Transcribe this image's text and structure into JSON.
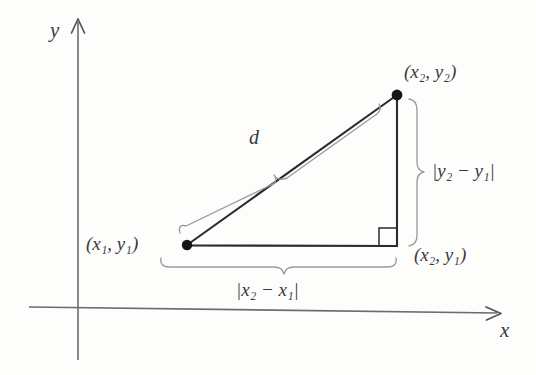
{
  "figure": {
    "background_color": "#fdfdfc",
    "axis_color": "#6b6b70",
    "triangle_color": "#2b2b2e",
    "brace_color": "#8d8d92",
    "label_color": "#3a3a3c",
    "axes": {
      "x_label": "x",
      "y_label": "y",
      "origin": {
        "x": 78,
        "y": 310
      }
    },
    "points": [
      {
        "name": "lower-left-vertex",
        "label": "(x₁, y₁)",
        "label_parts": {
          "open": "(",
          "a": "x",
          "a_sub": "1",
          "sep": ", ",
          "b": "y",
          "b_sub": "1",
          "close": ")"
        },
        "x": 187,
        "y": 245,
        "dot": true
      },
      {
        "name": "upper-right-vertex",
        "label": "(x₂, y₂)",
        "label_parts": {
          "open": "(",
          "a": "x",
          "a_sub": "2",
          "sep": ", ",
          "b": "y",
          "b_sub": "2",
          "close": ")"
        },
        "x": 397,
        "y": 95,
        "dot": true
      },
      {
        "name": "lower-right-vertex",
        "label": "(x₂, y₁)",
        "label_parts": {
          "open": "(",
          "a": "x",
          "a_sub": "2",
          "sep": ", ",
          "b": "y",
          "b_sub": "1",
          "close": ")"
        },
        "x": 397,
        "y": 245,
        "dot": false
      }
    ],
    "measures": {
      "hypotenuse": {
        "label": "d",
        "name": "distance-d"
      },
      "vertical_leg": {
        "label": "|y₂ − y₁|",
        "label_parts": {
          "bar1": "|",
          "a": "y",
          "a_sub": "2",
          "minus": " − ",
          "b": "y",
          "b_sub": "1",
          "bar2": "|"
        }
      },
      "horizontal_leg": {
        "label": "|x₂ − x₁|",
        "label_parts": {
          "bar1": "|",
          "a": "x",
          "a_sub": "2",
          "minus": " − ",
          "b": "x",
          "b_sub": "1",
          "bar2": "|"
        }
      }
    },
    "right_angle_marker": {
      "name": "right-angle-square",
      "x": 397,
      "y": 245
    }
  }
}
